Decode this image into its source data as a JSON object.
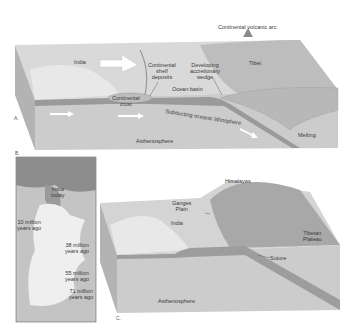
{
  "panel_a": {
    "letter": "A.",
    "labels": {
      "volcanic_arc": "Continental volcanic arc",
      "india": "India",
      "tibet": "Tibet",
      "shelf": "Continental\nshelf\ndeposits",
      "wedge": "Developing\naccretionary\nwedge",
      "ocean_basin": "Ocean basin",
      "crust": "Continental\ncrust",
      "subducting": "Subducting oceanic lithosphere",
      "asthenosphere": "Asthenosphere",
      "melting": "Melting"
    }
  },
  "panel_b": {
    "letter": "B.",
    "labels": {
      "india_today": "India\ntoday",
      "m10": "10 million\nyears ago",
      "m38": "38 million\nyears ago",
      "m55": "55 million\nyears ago",
      "m71": "71 million\nyears ago"
    }
  },
  "panel_c": {
    "letter": "C.",
    "labels": {
      "himalayas": "Himalayas",
      "ganges": "Ganges\nPlain",
      "india": "India",
      "tibetan_plateau": "Tibetan\nPlateau",
      "suture": "Suture",
      "asthenosphere": "Asthenosphere"
    }
  },
  "colors": {
    "surface": "#d6d6d6",
    "block_front": "#c9c9c9",
    "block_side": "#b5b5b5",
    "plate": "#8f8f8f",
    "arrow": "#ffffff"
  }
}
